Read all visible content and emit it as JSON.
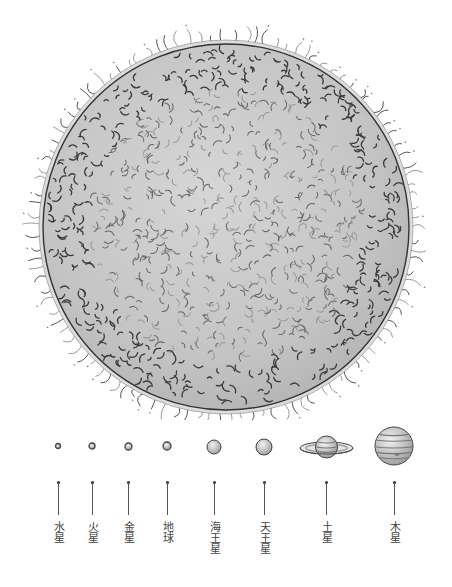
{
  "diagram": {
    "sun": {
      "center_x": 226,
      "center_y": 227,
      "radius": 183,
      "fill": "#c9c9c9",
      "outline": "#333333"
    },
    "planets": [
      {
        "name": "水星",
        "key": "mercury",
        "x": 58,
        "y": 446,
        "r": 2.5,
        "label_top": 510
      },
      {
        "name": "火星",
        "key": "mars",
        "x": 92,
        "y": 446,
        "r": 3,
        "label_top": 510
      },
      {
        "name": "金星",
        "key": "venus",
        "x": 128,
        "y": 446,
        "r": 3.5,
        "label_top": 510
      },
      {
        "name": "地球",
        "key": "earth",
        "x": 167,
        "y": 446,
        "r": 4,
        "label_top": 510
      },
      {
        "name": "海王星",
        "key": "neptune",
        "x": 214,
        "y": 447,
        "r": 7,
        "label_top": 510
      },
      {
        "name": "天王星",
        "key": "uranus",
        "x": 264,
        "y": 447,
        "r": 8,
        "label_top": 510
      },
      {
        "name": "土星",
        "key": "saturn",
        "x": 326,
        "y": 447,
        "r": 11,
        "ring": true,
        "label_top": 510
      },
      {
        "name": "木星",
        "key": "jupiter",
        "x": 394,
        "y": 446,
        "r": 19,
        "label_top": 510
      }
    ],
    "leader_top": 482,
    "leader_bottom": 515,
    "colors": {
      "planet_fill": "#d8d8d8",
      "planet_outline": "#444444",
      "text": "#444444",
      "leader": "#555555"
    }
  }
}
